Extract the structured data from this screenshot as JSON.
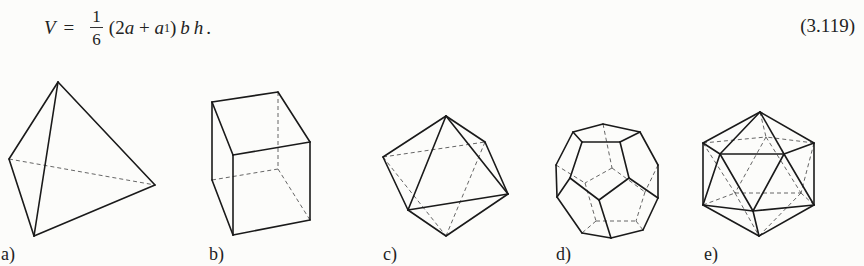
{
  "formula": {
    "lhs": "V",
    "equals": "=",
    "frac_num": "1",
    "frac_den": "6",
    "open_paren": "(2",
    "a": "a",
    "plus": " + ",
    "a1": "a",
    "sub1": "1",
    "close_paren": ")",
    "b": "b",
    "h": "h",
    "period": "."
  },
  "equation_number": "(3.119)",
  "figures": [
    {
      "label": "a)",
      "name": "tetrahedron"
    },
    {
      "label": "b)",
      "name": "cube"
    },
    {
      "label": "c)",
      "name": "octahedron"
    },
    {
      "label": "d)",
      "name": "dodecahedron"
    },
    {
      "label": "e)",
      "name": "icosahedron"
    }
  ],
  "colors": {
    "background": "#fcfcfa",
    "ink": "#1a1a1a"
  }
}
